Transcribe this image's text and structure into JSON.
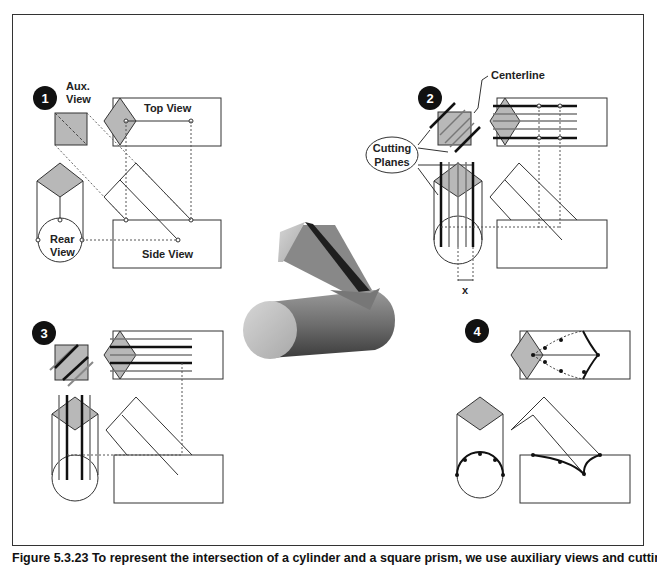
{
  "figure": {
    "caption": "Figure 5.3.23 To represent the intersection of a cylinder and a square prism, we use auxiliary views and cutting planes",
    "steps": [
      {
        "number": "1",
        "labels": {
          "aux_view": "Aux.",
          "aux_view2": "View",
          "top_view": "Top View",
          "rear_view": "Rear",
          "rear_view2": "View",
          "side_view": "Side View"
        }
      },
      {
        "number": "2",
        "labels": {
          "centerline": "Centerline",
          "cutting_planes": "Cutting",
          "cutting_planes2": "Planes",
          "x_dim": "x"
        }
      },
      {
        "number": "3"
      },
      {
        "number": "4"
      }
    ],
    "center_image": "3d-prism-cylinder-intersection",
    "colors": {
      "fill_gray": "#b8b8b8",
      "line": "#333333",
      "badge": "#111111"
    }
  }
}
